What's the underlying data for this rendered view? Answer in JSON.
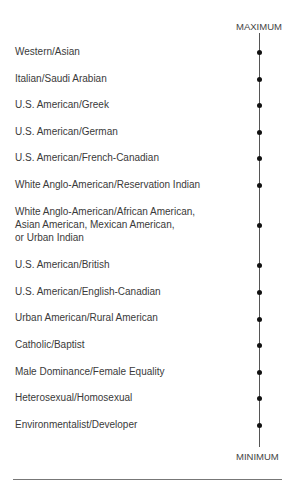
{
  "diagram": {
    "type": "continuum",
    "top_label": "MAXIMUM",
    "bottom_label": "MINIMUM",
    "items": [
      {
        "label": "Western/Asian",
        "label_y": 45,
        "dot_y": 52
      },
      {
        "label": "Italian/Saudi Arabian",
        "label_y": 72,
        "dot_y": 79
      },
      {
        "label": "U.S. American/Greek",
        "label_y": 98,
        "dot_y": 105
      },
      {
        "label": "U.S. American/German",
        "label_y": 125,
        "dot_y": 132
      },
      {
        "label": "U.S. American/French-Canadian",
        "label_y": 151,
        "dot_y": 158
      },
      {
        "label": "White Anglo-American/Reservation Indian",
        "label_y": 178,
        "dot_y": 185
      },
      {
        "label": "White Anglo-American/African American,\nAsian American, Mexican American,\nor Urban Indian",
        "label_y": 205,
        "dot_y": 225
      },
      {
        "label": "U.S. American/British",
        "label_y": 258,
        "dot_y": 265
      },
      {
        "label": "U.S. American/English-Canadian",
        "label_y": 285,
        "dot_y": 292
      },
      {
        "label": "Urban American/Rural American",
        "label_y": 311,
        "dot_y": 319
      },
      {
        "label": "Catholic/Baptist",
        "label_y": 338,
        "dot_y": 345
      },
      {
        "label": "Male Dominance/Female Equality",
        "label_y": 365,
        "dot_y": 372
      },
      {
        "label": "Heterosexual/Homosexual",
        "label_y": 391,
        "dot_y": 398
      },
      {
        "label": "Environmentalist/Developer",
        "label_y": 418,
        "dot_y": 425
      }
    ]
  },
  "colors": {
    "text": "#3a3a3a",
    "axis": "#555555",
    "dot": "#111111",
    "rule": "#777777"
  }
}
